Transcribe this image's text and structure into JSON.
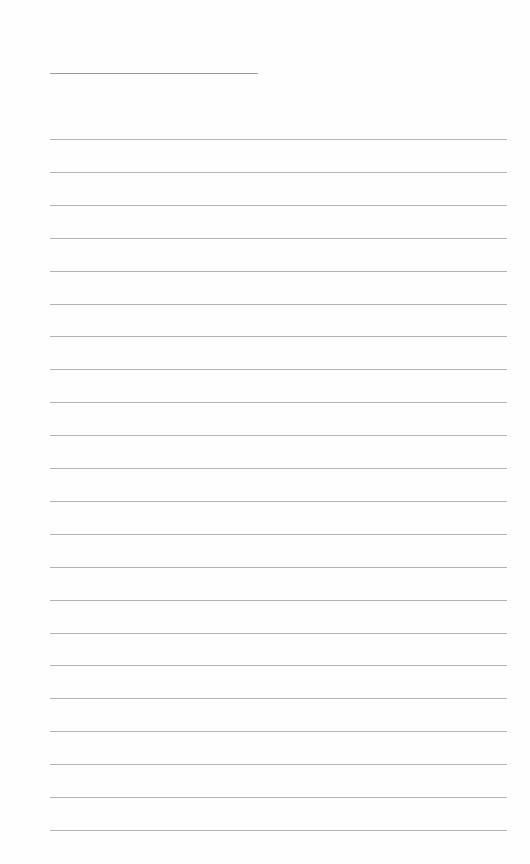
{
  "document": {
    "type": "blank lined sheet",
    "header_line": {
      "label": ""
    },
    "ruled_lines": {
      "count": 22,
      "first_top": 139,
      "spacing": 32.9,
      "left": 50,
      "width": 457
    },
    "colors": {
      "background": "#fefefe",
      "rule": "#b4b4b4",
      "header_rule": "#9a9a9a"
    }
  }
}
